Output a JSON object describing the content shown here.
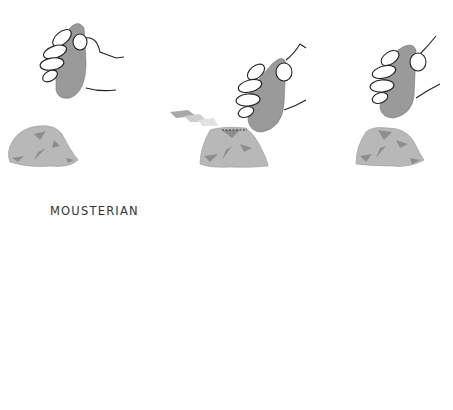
{
  "diagram": {
    "section_label": "MOUSTERIAN",
    "colors": {
      "hammerstone": "#9a9a9a",
      "core": "#b8b8b8",
      "core_facets": "#8e8e8e",
      "flake": "#a8a8a8",
      "outline": "#222222",
      "arc": "#555555"
    },
    "top_row": {
      "panels": [
        {
          "id": "step-1",
          "description": "hand holding hammerstone above core"
        },
        {
          "id": "step-2",
          "description": "hammerstone strikes core, flake detaches along dashed line"
        },
        {
          "id": "step-3",
          "description": "hand holding hammerstone above reshaped core"
        }
      ]
    },
    "bottom_row": {
      "panels": [
        {
          "id": "step-4",
          "description": "hammerstone strikes prepared core, large flake removed"
        },
        {
          "id": "step-5",
          "description": "hand with pointed punch strikes core, arrow indicates sequence"
        }
      ]
    }
  }
}
